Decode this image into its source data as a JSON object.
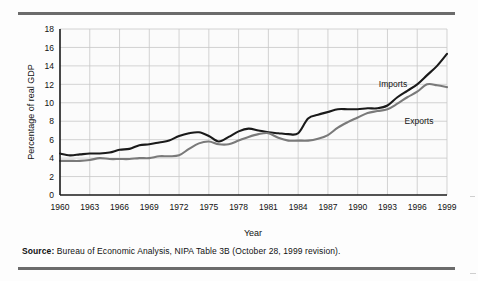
{
  "figure": {
    "source_label": "Source:",
    "source_text": "Bureau of Economic Analysis, NIPA Table 3B (October 28, 1999 revision)."
  },
  "colors": {
    "imports_line": "#1a1a1a",
    "exports_line": "#7a7a7a",
    "grid": "#c8c8c8",
    "axis": "#1a1a1a",
    "rule": "#6b6b6b",
    "plot_background": "#fbfbfb",
    "text": "#111111"
  },
  "chart_data": {
    "type": "line",
    "title": "",
    "xlabel": "Year",
    "ylabel": "Percentage of real GDP",
    "xlim": [
      1960,
      1999
    ],
    "ylim": [
      0,
      18
    ],
    "grid": true,
    "legend": "inline-labels",
    "y_ticks": [
      0,
      2,
      4,
      6,
      8,
      10,
      12,
      14,
      16,
      18
    ],
    "x_ticks": [
      1960,
      1963,
      1966,
      1969,
      1972,
      1975,
      1978,
      1981,
      1984,
      1987,
      1990,
      1993,
      1996,
      1999
    ],
    "x": [
      1960,
      1961,
      1962,
      1963,
      1964,
      1965,
      1966,
      1967,
      1968,
      1969,
      1970,
      1971,
      1972,
      1973,
      1974,
      1975,
      1976,
      1977,
      1978,
      1979,
      1980,
      1981,
      1982,
      1983,
      1984,
      1985,
      1986,
      1987,
      1988,
      1989,
      1990,
      1991,
      1992,
      1993,
      1994,
      1995,
      1996,
      1997,
      1998,
      1999
    ],
    "series": [
      {
        "name": "Imports",
        "color": "#1a1a1a",
        "label_position": "upper-right",
        "values": [
          4.5,
          4.3,
          4.4,
          4.5,
          4.5,
          4.6,
          4.9,
          5.0,
          5.4,
          5.5,
          5.7,
          5.9,
          6.4,
          6.7,
          6.8,
          6.4,
          5.8,
          6.3,
          6.9,
          7.2,
          7.0,
          6.8,
          6.7,
          6.6,
          6.7,
          8.3,
          8.7,
          9.0,
          9.3,
          9.3,
          9.3,
          9.4,
          9.4,
          9.7,
          10.6,
          11.3,
          12.0,
          13.0,
          14.0,
          15.3
        ]
      },
      {
        "name": "Exports",
        "color": "#7a7a7a",
        "label_position": "lower-right",
        "values": [
          3.7,
          3.7,
          3.7,
          3.8,
          4.0,
          3.9,
          3.9,
          3.9,
          4.0,
          4.0,
          4.2,
          4.2,
          4.3,
          5.0,
          5.6,
          5.8,
          5.5,
          5.5,
          5.9,
          6.3,
          6.6,
          6.7,
          6.2,
          5.9,
          5.9,
          5.9,
          6.1,
          6.5,
          7.3,
          7.9,
          8.4,
          8.9,
          9.1,
          9.3,
          9.9,
          10.6,
          11.2,
          12.0,
          11.9,
          11.7
        ]
      }
    ],
    "annotations": [
      {
        "text": "Imports",
        "series": "Imports"
      },
      {
        "text": "Exports",
        "series": "Exports"
      }
    ]
  }
}
